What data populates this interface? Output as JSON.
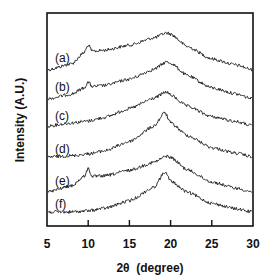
{
  "chart_data": {
    "type": "line",
    "title": "",
    "xlabel": "2θ  (degree)",
    "ylabel": "Intensity (A.U.)",
    "xlim": [
      5,
      30
    ],
    "x_ticks": [
      5,
      10,
      15,
      20,
      25,
      30
    ],
    "y_ticks": [],
    "grid": false,
    "legend": "inline labels at left of each curve",
    "stacked_offset": true,
    "series": [
      {
        "name": "(a)",
        "x": [
          5,
          8,
          9.5,
          10,
          10.5,
          12,
          15,
          18,
          19.5,
          20,
          22,
          25,
          28,
          30
        ],
        "y": [
          0.0,
          0.1,
          0.28,
          0.4,
          0.3,
          0.32,
          0.4,
          0.52,
          0.6,
          0.58,
          0.38,
          0.18,
          0.08,
          0.0
        ]
      },
      {
        "name": "(b)",
        "x": [
          5,
          8,
          9.5,
          10,
          10.5,
          12,
          15,
          18,
          19.5,
          20,
          22,
          25,
          28,
          30
        ],
        "y": [
          0.0,
          0.08,
          0.18,
          0.27,
          0.2,
          0.22,
          0.32,
          0.48,
          0.6,
          0.58,
          0.38,
          0.18,
          0.08,
          0.0
        ]
      },
      {
        "name": "(c)",
        "x": [
          5,
          8,
          10,
          12,
          15,
          18,
          19.5,
          20,
          22,
          25,
          28,
          30
        ],
        "y": [
          0.0,
          0.05,
          0.08,
          0.14,
          0.28,
          0.45,
          0.55,
          0.5,
          0.32,
          0.15,
          0.07,
          0.0
        ]
      },
      {
        "name": "(d)",
        "x": [
          5,
          8,
          10,
          12,
          15,
          18,
          19.3,
          20,
          22,
          25,
          28,
          30
        ],
        "y": [
          0.0,
          0.02,
          0.05,
          0.1,
          0.25,
          0.5,
          0.72,
          0.55,
          0.35,
          0.15,
          0.06,
          0.0
        ]
      },
      {
        "name": "(e)",
        "x": [
          5,
          8,
          9.5,
          10,
          10.5,
          12,
          15,
          18,
          19.5,
          20,
          22,
          25,
          28,
          30
        ],
        "y": [
          0.0,
          0.1,
          0.25,
          0.38,
          0.25,
          0.26,
          0.35,
          0.48,
          0.58,
          0.56,
          0.36,
          0.16,
          0.06,
          0.0
        ]
      },
      {
        "name": "(f)",
        "x": [
          5,
          8,
          10,
          12,
          15,
          18,
          19.3,
          20,
          22,
          25,
          28,
          30
        ],
        "y": [
          0.0,
          0.0,
          0.02,
          0.06,
          0.18,
          0.4,
          0.65,
          0.5,
          0.32,
          0.14,
          0.05,
          0.0
        ]
      }
    ]
  },
  "layout": {
    "baselines_px": [
      70,
      99,
      126,
      157,
      192,
      212
    ],
    "scale_px": [
      62,
      62,
      62,
      62,
      62,
      62
    ],
    "label_y_px": [
      58,
      87,
      116,
      149,
      181,
      204
    ]
  }
}
